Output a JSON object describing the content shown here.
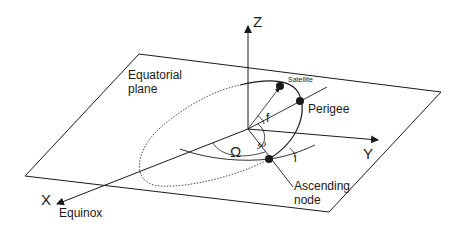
{
  "diagram": {
    "type": "orbital-elements",
    "axes": {
      "z": "Z",
      "y": "Y",
      "x": "X"
    },
    "labels": {
      "equatorial_plane_line1": "Equatorial",
      "equatorial_plane_line2": "plane",
      "satellite": "Satellite",
      "perigee": "Perigee",
      "ascending_node_line1": "Ascending",
      "ascending_node_line2": "node",
      "equinox": "Equinox"
    },
    "angles": {
      "true_anomaly": "f",
      "raan": "Ω",
      "arg_perigee": "ω",
      "inclination": "i"
    },
    "colors": {
      "line": "#1a1a1a",
      "background": "#ffffff"
    }
  }
}
